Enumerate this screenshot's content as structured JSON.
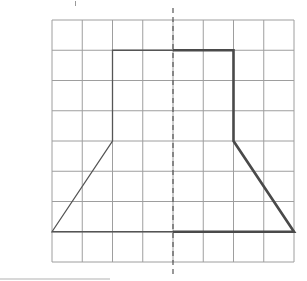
{
  "diagram": {
    "type": "symmetry-grid",
    "grid": {
      "columns": 8,
      "rows": 8,
      "origin_px": [
        52,
        20
      ],
      "cell_px": 30.25,
      "line_color": "#9e9e9e"
    },
    "axis_of_symmetry": {
      "style": "dashed",
      "x_cell": 4,
      "color": "#555555",
      "extends_beyond_grid": true
    },
    "shape_left_half": {
      "description": "given half, thin line",
      "points": [
        [
          4,
          1
        ],
        [
          2,
          1
        ],
        [
          2,
          4
        ],
        [
          0,
          7
        ],
        [
          4,
          7
        ]
      ],
      "stroke": "#555555",
      "stroke_width": 1.3
    },
    "shape_right_half": {
      "description": "reflected half, thick line",
      "points": [
        [
          4,
          1
        ],
        [
          6,
          1
        ],
        [
          6,
          4
        ],
        [
          8,
          7
        ],
        [
          4,
          7
        ]
      ],
      "stroke": "#4a4a4a",
      "stroke_width": 2.6
    }
  }
}
